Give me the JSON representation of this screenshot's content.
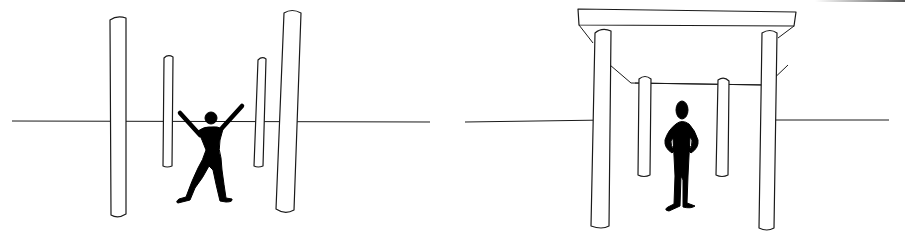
{
  "figure": {
    "panels": [
      {
        "id": "left",
        "description": "Figure with arms raised standing among four free-standing columns",
        "columns": 4,
        "pose": "arms-raised-legs-apart"
      },
      {
        "id": "right",
        "description": "Figure with hands on hips standing under a roofed portal on four columns",
        "columns": 4,
        "pose": "hands-on-hips",
        "roof": true
      }
    ],
    "colors": {
      "background": "#ffffff",
      "line": "#1a1a1a",
      "figure": "#000000"
    }
  }
}
